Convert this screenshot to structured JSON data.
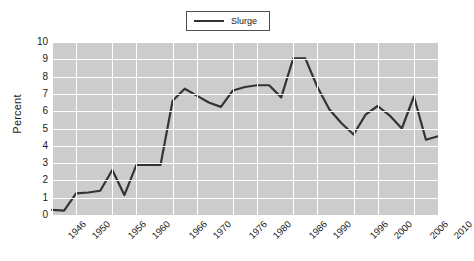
{
  "legend": {
    "position": "top-center",
    "entries": [
      {
        "label": "Slurge",
        "color": "#333333",
        "marker": "line"
      }
    ]
  },
  "axes": {
    "ylabel": "Percent",
    "xlabel": "",
    "yticks": [
      "0",
      "1",
      "2",
      "3",
      "4",
      "5",
      "6",
      "7",
      "8",
      "9",
      "10"
    ],
    "xticks": [
      "1946",
      "1950",
      "1956",
      "1960",
      "1966",
      "1970",
      "1976",
      "1980",
      "1986",
      "1990",
      "1996",
      "2000",
      "2006",
      "2010"
    ]
  },
  "style": {
    "plot_background": "#cccccc",
    "grid_color": "#ffffff",
    "line_color": "#333333",
    "figure_background": "#ffffff",
    "text_color": "#1a1a1a"
  },
  "chart_data": {
    "type": "line",
    "title": "",
    "xlabel": "",
    "ylabel": "Percent",
    "xlim": [
      1946,
      2010
    ],
    "ylim": [
      0,
      10
    ],
    "grid": true,
    "legend_position": "upper center",
    "xticklabels": [
      "1946",
      "1950",
      "1956",
      "1960",
      "1966",
      "1970",
      "1976",
      "1980",
      "1986",
      "1990",
      "1996",
      "2000",
      "2006",
      "2010"
    ],
    "yticklabels": [
      "0",
      "1",
      "2",
      "3",
      "4",
      "5",
      "6",
      "7",
      "8",
      "9",
      "10"
    ],
    "x": [
      1946,
      1948,
      1950,
      1952,
      1954,
      1956,
      1958,
      1960,
      1962,
      1964,
      1966,
      1968,
      1970,
      1972,
      1974,
      1976,
      1978,
      1980,
      1982,
      1984,
      1986,
      1988,
      1990,
      1992,
      1994,
      1996,
      1998,
      2000,
      2002,
      2004,
      2006,
      2008,
      2010
    ],
    "series": [
      {
        "name": "Slurge",
        "color": "#333333",
        "values": [
          0.3,
          0.25,
          1.25,
          1.3,
          1.4,
          2.6,
          1.15,
          2.9,
          2.9,
          2.9,
          6.6,
          7.3,
          6.9,
          6.5,
          6.25,
          7.2,
          7.4,
          7.5,
          7.5,
          6.8,
          9.05,
          9.05,
          7.4,
          6.1,
          5.3,
          4.65,
          5.8,
          6.3,
          5.75,
          5.0,
          6.85,
          4.35,
          4.55
        ]
      }
    ]
  }
}
